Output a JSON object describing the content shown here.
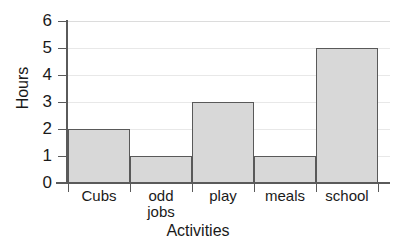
{
  "chart_data": {
    "type": "bar",
    "title": "",
    "subtitle": "",
    "xlabel": "Activities",
    "ylabel": "Hours",
    "categories": [
      "Cubs",
      "odd jobs",
      "play",
      "meals",
      "school"
    ],
    "category_lines": [
      [
        "Cubs"
      ],
      [
        "odd",
        "jobs"
      ],
      [
        "play"
      ],
      [
        "meals"
      ],
      [
        "school"
      ]
    ],
    "values": [
      2,
      1,
      3,
      1,
      5
    ],
    "series": [
      {
        "name": "Hours",
        "values": [
          2,
          1,
          3,
          1,
          5
        ]
      }
    ],
    "ylim": [
      0,
      6
    ],
    "ytick_labels": [
      "0",
      "1",
      "2",
      "3",
      "4",
      "5",
      "6"
    ],
    "ytick_values": [
      0,
      1,
      2,
      3,
      4,
      5,
      6
    ],
    "grid": true,
    "grid_axis": "y",
    "legend": false,
    "legend_position": "none",
    "bar_gap": 0,
    "colors": {
      "bar_fill": "#d8d8d8",
      "bar_edge": "#595959",
      "gridline": "#e8e8e8",
      "axis": "#5a5a5a",
      "text": "#1a1a1a",
      "background": "#ffffff"
    }
  }
}
